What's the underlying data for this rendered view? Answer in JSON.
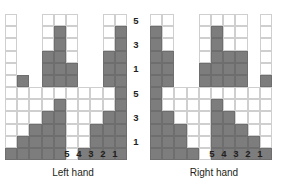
{
  "figure": {
    "type": "paired-grid-bar-chart",
    "background": "#ffffff",
    "filled_color": "#7d7d7d",
    "empty_color": "#ffffff",
    "gridline_color": "#cfcfcf",
    "text_color": "#231f20"
  },
  "captions": {
    "left": "Left hand",
    "right": "Right hand"
  },
  "axes": {
    "y_ticks_top": [
      "5",
      "3",
      "1"
    ],
    "y_ticks_bottom": [
      "5",
      "3",
      "1"
    ],
    "x_ticks": [
      "5",
      "4",
      "3",
      "2",
      "1"
    ]
  },
  "chart_data": {
    "type": "bar",
    "title": "",
    "xlabel": "",
    "ylabel": "",
    "panels": [
      {
        "name": "Left hand",
        "caption": "Left hand",
        "columns": 10,
        "rows": 12,
        "x_tick_labels": [
          "5",
          "4",
          "3",
          "2",
          "1"
        ],
        "x_tick_columns": [
          5,
          6,
          7,
          8,
          9
        ],
        "y_tick_labels_upper": [
          "5",
          "3",
          "1"
        ],
        "y_tick_labels_lower": [
          "5",
          "3",
          "1"
        ],
        "upper_half": {
          "label": "upper",
          "rows": 6,
          "ylim": [
            0,
            6
          ],
          "y_ticks": [
            5,
            3,
            1
          ],
          "values": [
            0,
            1,
            0,
            3,
            5,
            2,
            0,
            0,
            3,
            5
          ],
          "outline_columns": [
            0,
            3,
            4,
            5,
            8,
            9
          ]
        },
        "lower_half": {
          "label": "lower",
          "rows": 6,
          "ylim": [
            0,
            6
          ],
          "y_ticks": [
            5,
            3,
            1
          ],
          "values": [
            1,
            2,
            3,
            4,
            5,
            0,
            1,
            3,
            4,
            6
          ],
          "outline_columns": [
            0,
            1,
            2,
            3,
            4,
            5,
            6,
            7,
            8,
            9
          ]
        }
      },
      {
        "name": "Right hand",
        "caption": "Right hand",
        "columns": 10,
        "rows": 12,
        "x_tick_labels": [
          "5",
          "4",
          "3",
          "2",
          "1"
        ],
        "x_tick_columns": [
          5,
          6,
          7,
          8,
          9
        ],
        "y_tick_labels_upper": [
          "5",
          "3",
          "1"
        ],
        "y_tick_labels_lower": [
          "5",
          "3",
          "1"
        ],
        "upper_half": {
          "label": "upper",
          "rows": 6,
          "ylim": [
            0,
            6
          ],
          "y_ticks": [
            5,
            3,
            1
          ],
          "values": [
            5,
            3,
            0,
            0,
            2,
            5,
            3,
            3,
            0,
            1
          ],
          "outline_columns": [
            0,
            1,
            4,
            5,
            6,
            7,
            9
          ]
        },
        "lower_half": {
          "label": "lower",
          "rows": 6,
          "ylim": [
            0,
            6
          ],
          "y_ticks": [
            5,
            3,
            1
          ],
          "values": [
            6,
            4,
            3,
            1,
            0,
            5,
            4,
            3,
            2,
            1
          ],
          "outline_columns": [
            0,
            1,
            2,
            3,
            4,
            5,
            6,
            7,
            8,
            9
          ]
        }
      }
    ]
  }
}
